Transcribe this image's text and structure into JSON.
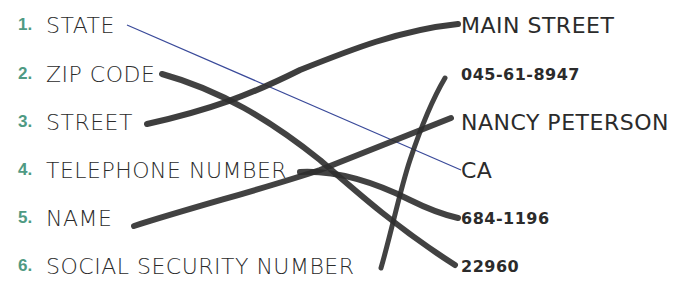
{
  "worksheet": {
    "left_items": [
      {
        "number": "1.",
        "label": "STATE"
      },
      {
        "number": "2.",
        "label": "ZIP CODE"
      },
      {
        "number": "3.",
        "label": "STREET"
      },
      {
        "number": "4.",
        "label": "TELEPHONE NUMBER"
      },
      {
        "number": "5.",
        "label": "NAME"
      },
      {
        "number": "6.",
        "label": "SOCIAL SECURITY NUMBER"
      }
    ],
    "right_items": [
      {
        "value": "MAIN STREET"
      },
      {
        "value": "045-61-8947"
      },
      {
        "value": "NANCY PETERSON"
      },
      {
        "value": "CA"
      },
      {
        "value": "684-1196"
      },
      {
        "value": "22960"
      }
    ],
    "connections": [
      {
        "from": "STATE",
        "to": "CA",
        "style": "thin blue line"
      },
      {
        "from": "ZIP CODE",
        "to": "22960",
        "style": "marker"
      },
      {
        "from": "STREET",
        "to": "MAIN STREET",
        "style": "marker"
      },
      {
        "from": "TELEPHONE NUMBER",
        "to": "684-1196",
        "style": "marker"
      },
      {
        "from": "NAME",
        "to": "NANCY PETERSON",
        "style": "marker"
      },
      {
        "from": "SOCIAL SECURITY NUMBER",
        "to": "045-61-8947",
        "style": "marker"
      }
    ],
    "colors": {
      "number": "#4f9a83",
      "text": "#2b2b2b",
      "marker": "#2e2e2e",
      "thin_line": "#3a4a9a"
    }
  }
}
